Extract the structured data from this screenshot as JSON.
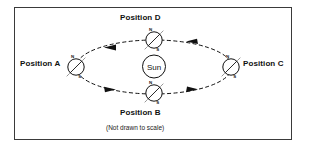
{
  "diagram": {
    "caption": "(Not drawn to scale)",
    "sun": {
      "label": "Sun"
    },
    "positions": [
      {
        "id": "A",
        "label": "Position A",
        "north_pole_label": "N",
        "south_pole_label": "S",
        "location": "left"
      },
      {
        "id": "B",
        "label": "Position B",
        "north_pole_label": "N",
        "south_pole_label": "S",
        "location": "bottom"
      },
      {
        "id": "C",
        "label": "Position C",
        "north_pole_label": "N",
        "south_pole_label": "S",
        "location": "right"
      },
      {
        "id": "D",
        "label": "Position D",
        "north_pole_label": "N",
        "south_pole_label": "S",
        "location": "top"
      }
    ],
    "orbit": {
      "style": "dashed ellipse",
      "direction": "counterclockwise",
      "arrow_count": 4
    },
    "colors": {
      "stroke": "#111111",
      "border": "#3a3a3a",
      "background": "#ffffff"
    }
  }
}
